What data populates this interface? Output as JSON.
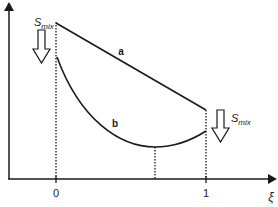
{
  "diagram": {
    "y_axis": {
      "label": ""
    },
    "x_axis": {
      "label": "ξ",
      "ticks": [
        "0",
        "1"
      ]
    },
    "curves": [
      {
        "id": "a",
        "label": "a",
        "shape": "straight line, decreasing from ξ=0 to ξ=1"
      },
      {
        "id": "b",
        "label": "b",
        "shape": "convex curve with minimum between 0 and 1"
      }
    ],
    "annotations": {
      "left_arrow_label_main": "S",
      "left_arrow_label_sub": "mix",
      "right_arrow_label_main": "S",
      "right_arrow_label_sub": "mix"
    },
    "colors": {
      "line": "#1a1a1a",
      "background": "#ffffff"
    }
  }
}
